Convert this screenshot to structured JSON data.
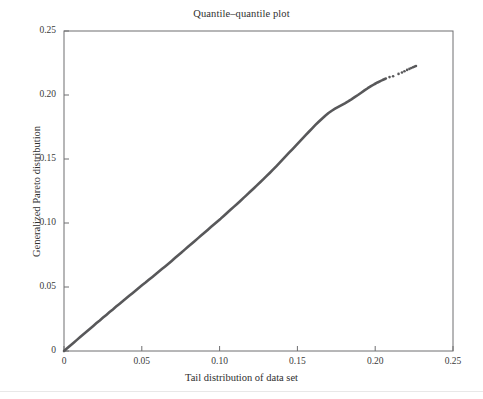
{
  "chart_data": {
    "type": "line",
    "title": "Quantile–quantile plot",
    "xlabel": "Tail distribution of data set",
    "ylabel": "Generalized Pareto distribution",
    "xlim": [
      0,
      0.25
    ],
    "ylim": [
      0,
      0.25
    ],
    "xticks": [
      "0",
      "0.05",
      "0.10",
      "0.15",
      "0.20",
      "0.25"
    ],
    "xtick_values": [
      0,
      0.05,
      0.1,
      0.15,
      0.2,
      0.25
    ],
    "yticks": [
      "0",
      "0.05",
      "0.10",
      "0.15",
      "0.20",
      "0.25"
    ],
    "ytick_values": [
      0,
      0.05,
      0.1,
      0.15,
      0.2,
      0.25
    ],
    "grid": false,
    "legend": false,
    "series_color": "#58585a",
    "axis_color": "#6e6e70",
    "series": [
      {
        "name": "qq-points",
        "style": "dense-points",
        "x": [
          0.0,
          0.002,
          0.0041,
          0.0062,
          0.0083,
          0.0104,
          0.0125,
          0.0146,
          0.0167,
          0.0188,
          0.0209,
          0.023,
          0.0251,
          0.0272,
          0.0293,
          0.0314,
          0.0335,
          0.0356,
          0.0377,
          0.0398,
          0.0419,
          0.044,
          0.0461,
          0.0482,
          0.0503,
          0.0524,
          0.0545,
          0.0566,
          0.0587,
          0.0608,
          0.0629,
          0.065,
          0.0671,
          0.0692,
          0.0713,
          0.0734,
          0.0755,
          0.0776,
          0.0797,
          0.0818,
          0.0839,
          0.086,
          0.0881,
          0.0902,
          0.0923,
          0.0944,
          0.0965,
          0.0986,
          0.1007,
          0.1028,
          0.1049,
          0.107,
          0.1091,
          0.1112,
          0.1133,
          0.1154,
          0.1175,
          0.1196,
          0.1217,
          0.1238,
          0.1259,
          0.128,
          0.1301,
          0.1322,
          0.1343,
          0.1364,
          0.1385,
          0.1406,
          0.1427,
          0.1448,
          0.1469,
          0.149,
          0.1511,
          0.1532,
          0.1553,
          0.1574,
          0.1595,
          0.1616,
          0.1637,
          0.1658,
          0.1679,
          0.17,
          0.1721,
          0.1742,
          0.1763,
          0.1784,
          0.1805,
          0.1826,
          0.1847,
          0.1868,
          0.1889,
          0.191,
          0.1931,
          0.1952,
          0.1973,
          0.1994,
          0.2015,
          0.2036
        ],
        "y": [
          0.0,
          0.0021,
          0.0043,
          0.0065,
          0.0087,
          0.0109,
          0.0131,
          0.0152,
          0.0174,
          0.0196,
          0.0218,
          0.0239,
          0.0261,
          0.0282,
          0.0304,
          0.0325,
          0.0347,
          0.0368,
          0.0389,
          0.041,
          0.0431,
          0.0452,
          0.0473,
          0.0494,
          0.0515,
          0.0535,
          0.0556,
          0.0577,
          0.0598,
          0.0619,
          0.064,
          0.0661,
          0.0682,
          0.0704,
          0.0726,
          0.0748,
          0.077,
          0.0792,
          0.0814,
          0.0836,
          0.0858,
          0.088,
          0.0902,
          0.0924,
          0.0946,
          0.0968,
          0.099,
          0.1012,
          0.1034,
          0.1057,
          0.108,
          0.1103,
          0.1126,
          0.1149,
          0.1172,
          0.1196,
          0.122,
          0.1244,
          0.1268,
          0.1292,
          0.1316,
          0.1341,
          0.1366,
          0.1391,
          0.1417,
          0.1443,
          0.147,
          0.1497,
          0.1524,
          0.1551,
          0.1578,
          0.1605,
          0.1632,
          0.1659,
          0.1686,
          0.1713,
          0.174,
          0.1766,
          0.1791,
          0.1815,
          0.1838,
          0.1859,
          0.1877,
          0.1893,
          0.1907,
          0.1921,
          0.1935,
          0.195,
          0.1966,
          0.1983,
          0.2,
          0.2018,
          0.2036,
          0.2053,
          0.2069,
          0.2084,
          0.2098,
          0.211
        ]
      },
      {
        "name": "qq-tail-outliers",
        "style": "sparse-points",
        "x": [
          0.2045,
          0.2052,
          0.206,
          0.2068,
          0.2092,
          0.2115,
          0.215,
          0.2172,
          0.2188,
          0.2205,
          0.222,
          0.2232,
          0.2243,
          0.2253,
          0.2262
        ],
        "y": [
          0.2115,
          0.212,
          0.2124,
          0.2128,
          0.214,
          0.2147,
          0.2165,
          0.2176,
          0.2186,
          0.2196,
          0.2204,
          0.2211,
          0.2217,
          0.2222,
          0.2226
        ]
      }
    ]
  }
}
